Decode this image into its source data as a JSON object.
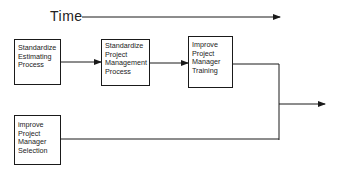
{
  "diagram": {
    "time_axis": {
      "label": "Time",
      "direction": "right"
    },
    "nodes": [
      {
        "id": "standardize-estimating",
        "lines": [
          "Standardize",
          "Estimating",
          "Process"
        ]
      },
      {
        "id": "standardize-pm-process",
        "lines": [
          "Standardize",
          "Project",
          "Management",
          "Process"
        ]
      },
      {
        "id": "improve-pm-training",
        "lines": [
          "Improve",
          "Project",
          "Manager",
          "Training"
        ]
      },
      {
        "id": "improve-pm-selection",
        "lines": [
          "improve",
          "Project",
          "Manager",
          "Selection"
        ]
      }
    ],
    "edges": [
      {
        "from": "standardize-estimating",
        "to": "standardize-pm-process",
        "arrow": true
      },
      {
        "from": "standardize-pm-process",
        "to": "improve-pm-training",
        "arrow": true
      },
      {
        "from": "improve-pm-training",
        "to": "output",
        "arrow": true
      },
      {
        "from": "improve-pm-selection",
        "to": "output",
        "arrow": true
      }
    ],
    "colors": {
      "line": "#1a1a1a",
      "background": "#ffffff"
    }
  }
}
